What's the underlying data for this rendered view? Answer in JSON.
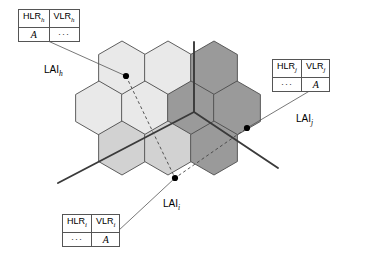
{
  "figure": {
    "kind": "cellular-network-location-area-diagram",
    "background": "#ffffff"
  },
  "colors": {
    "lai_h_fill": "#e9e9e9",
    "lai_i_fill": "#d2d2d2",
    "lai_j_fill": "#9a9a9a",
    "cell_stroke": "#4d4d4d",
    "boundary_line": "#3a3a3a",
    "leader_line": "#555555",
    "dashed_path": "#444444",
    "dot": "#000000"
  },
  "tables": {
    "h": {
      "name": "hlr-vlr-table-h",
      "headers": [
        "HLR",
        "VLR"
      ],
      "header_subscripts": [
        "h",
        "h"
      ],
      "row": [
        "A",
        "···"
      ],
      "row_kinds": [
        "value",
        "dots"
      ]
    },
    "j": {
      "name": "hlr-vlr-table-j",
      "headers": [
        "HLR",
        "VLR"
      ],
      "header_subscripts": [
        "j",
        "j"
      ],
      "row": [
        "···",
        "A"
      ],
      "row_kinds": [
        "dots",
        "value"
      ]
    },
    "i": {
      "name": "hlr-vlr-table-i",
      "headers": [
        "HLR",
        "VLR"
      ],
      "header_subscripts": [
        "i",
        "i"
      ],
      "row": [
        "···",
        "A"
      ],
      "row_kinds": [
        "dots",
        "value"
      ]
    }
  },
  "labels": {
    "lai_h": {
      "text": "LAI",
      "subscript": "h"
    },
    "lai_j": {
      "text": "LAI",
      "subscript": "j"
    },
    "lai_i": {
      "text": "LAI",
      "subscript": "i"
    }
  },
  "cells": [
    {
      "id": "c1",
      "cx": 122,
      "cy": 68,
      "area": "h"
    },
    {
      "id": "c2",
      "cx": 168,
      "cy": 68,
      "area": "h"
    },
    {
      "id": "c3",
      "cx": 214,
      "cy": 68,
      "area": "j"
    },
    {
      "id": "c4",
      "cx": 99,
      "cy": 108,
      "area": "h"
    },
    {
      "id": "c5",
      "cx": 145,
      "cy": 108,
      "area": "h"
    },
    {
      "id": "c6",
      "cx": 191,
      "cy": 108,
      "area": "j"
    },
    {
      "id": "c7",
      "cx": 237,
      "cy": 108,
      "area": "j"
    },
    {
      "id": "c8",
      "cx": 122,
      "cy": 148,
      "area": "i"
    },
    {
      "id": "c9",
      "cx": 168,
      "cy": 148,
      "area": "i"
    },
    {
      "id": "c10",
      "cx": 214,
      "cy": 148,
      "area": "j"
    }
  ],
  "terminals": [
    {
      "id": "dot-h",
      "x": 126,
      "y": 76,
      "label": "mobile-position-in-lai-h"
    },
    {
      "id": "dot-i",
      "x": 175,
      "y": 178,
      "label": "mobile-position-in-lai-i"
    },
    {
      "id": "dot-j",
      "x": 247,
      "y": 128,
      "label": "mobile-position-in-lai-j"
    }
  ],
  "boundary_lines": [
    {
      "id": "boundary-north",
      "x1": 194,
      "y1": 42,
      "x2": 194,
      "y2": 112
    },
    {
      "id": "boundary-southwest",
      "x1": 194,
      "y1": 112,
      "x2": 58,
      "y2": 183
    },
    {
      "id": "boundary-southeast",
      "x1": 194,
      "y1": 112,
      "x2": 278,
      "y2": 168
    }
  ],
  "leaders": [
    {
      "id": "leader-h",
      "x1": 28,
      "y1": 32,
      "x2": 126,
      "y2": 76
    },
    {
      "id": "leader-j",
      "x1": 318,
      "y1": 86,
      "x2": 247,
      "y2": 128
    },
    {
      "id": "leader-i",
      "x1": 118,
      "y1": 231,
      "x2": 175,
      "y2": 178
    }
  ],
  "movement_path": {
    "id": "dashed-handover-path",
    "points": [
      [
        126,
        76
      ],
      [
        175,
        178
      ],
      [
        247,
        128
      ]
    ],
    "style": "dashed"
  }
}
